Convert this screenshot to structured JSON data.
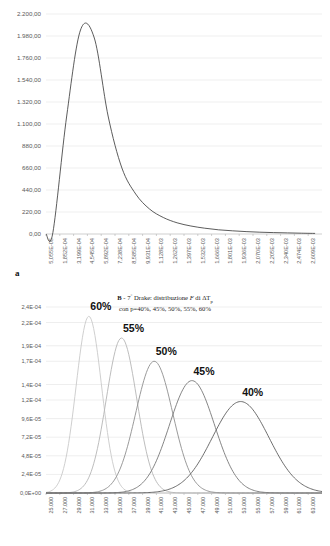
{
  "figure": {
    "panel_a_letter": "a",
    "panel_b_letter": "b"
  },
  "caption_b": {
    "line1_prefix": "B",
    "line1_dash": " - ",
    "line1_mid": "7",
    "line1_deg": "°",
    "line1_rest": " Drake: distribuzione ",
    "line1_F": "F",
    "line1_di": " di ",
    "line1_delta": "ΔT",
    "line1_sub": "p",
    "line2": "con p=40%, 45%, 50%, 55%, 60%"
  },
  "chart_data": [
    {
      "id": "panel-a",
      "type": "line",
      "title": "",
      "xlabel": "",
      "ylabel": "",
      "grid": true,
      "legend": "none",
      "ylim": [
        0,
        2200
      ],
      "yticks": [
        "0,00",
        "220,00",
        "440,00",
        "660,00",
        "880,00",
        "1.100,00",
        "1.320,00",
        "1.540,00",
        "1.760,00",
        "1.980,00",
        "2.200,00"
      ],
      "ytick_values": [
        0,
        220,
        440,
        660,
        880,
        1100,
        1320,
        1540,
        1760,
        1980,
        2200
      ],
      "xticks": [
        "5,055E-05",
        "1,852E-04",
        "3,199E-04",
        "4,545E-04",
        "5,892E-04",
        "7,238E-04",
        "8,585E-04",
        "9,931E-04",
        "1,128E-03",
        "1,262E-03",
        "1,397E-03",
        "1,532E-03",
        "1,666E-03",
        "1,801E-03",
        "1,936E-03",
        "2,070E-03",
        "2,205E-03",
        "2,340E-03",
        "2,474E-03",
        "2,609E-03"
      ],
      "x": [
        5.055e-05,
        0.0001852,
        0.0003199,
        0.0004545,
        0.0005892,
        0.0007238,
        0.0008585,
        0.0009931,
        0.001128,
        0.001262,
        0.001397,
        0.001532,
        0.001666,
        0.001801,
        0.001936,
        0.00207,
        0.002205,
        0.00234,
        0.002474,
        0.002609
      ],
      "values": [
        15,
        1180,
        2040,
        1960,
        1180,
        660,
        400,
        250,
        165,
        112,
        80,
        58,
        42,
        32,
        24,
        18,
        14,
        11,
        8,
        6
      ],
      "peak_value": 2040,
      "peak_x": "3,199E-04",
      "series_color": "#404040"
    },
    {
      "id": "panel-b",
      "type": "line",
      "title": "",
      "xlabel": "",
      "ylabel": "",
      "grid": true,
      "legend": "inline-labels",
      "ylim": [
        0,
        0.00024
      ],
      "yticks": [
        "0,0E+00",
        "2,4E-05",
        "4,8E-05",
        "7,2E-05",
        "9,6E-05",
        "1,2E-04",
        "1,4E-04",
        "1,7E-04",
        "1,9E-04",
        "2,2E-04",
        "2,4E-04"
      ],
      "ytick_values": [
        0,
        2.4e-05,
        4.8e-05,
        7.2e-05,
        9.6e-05,
        0.00012,
        0.00014,
        0.00017,
        0.00019,
        0.00022,
        0.00024
      ],
      "xticks": [
        "25.000",
        "27.000",
        "29.000",
        "31.000",
        "33.000",
        "35.000",
        "37.000",
        "39.000",
        "41.000",
        "43.000",
        "45.000",
        "47.000",
        "49.000",
        "51.000",
        "53.000",
        "55.000",
        "57.000",
        "59.000",
        "61.000",
        "63.000"
      ],
      "xlim": [
        25000,
        63000
      ],
      "series": [
        {
          "name": "60%",
          "mean": 30900,
          "sigma": 1750,
          "peak": 0.000228,
          "color": "#c9c9c9",
          "label": "60%"
        },
        {
          "name": "55%",
          "mean": 35400,
          "sigma": 2100,
          "peak": 0.0002,
          "color": "#b5b5b5",
          "label": "55%"
        },
        {
          "name": "50%",
          "mean": 39900,
          "sigma": 2550,
          "peak": 0.00017,
          "color": "#8f8f8f",
          "label": "50%"
        },
        {
          "name": "45%",
          "mean": 45100,
          "sigma": 3100,
          "peak": 0.000145,
          "color": "#777777",
          "label": "45%"
        },
        {
          "name": "40%",
          "mean": 51800,
          "sigma": 3900,
          "peak": 0.000118,
          "color": "#5e5e5e",
          "label": "40%"
        }
      ]
    }
  ]
}
